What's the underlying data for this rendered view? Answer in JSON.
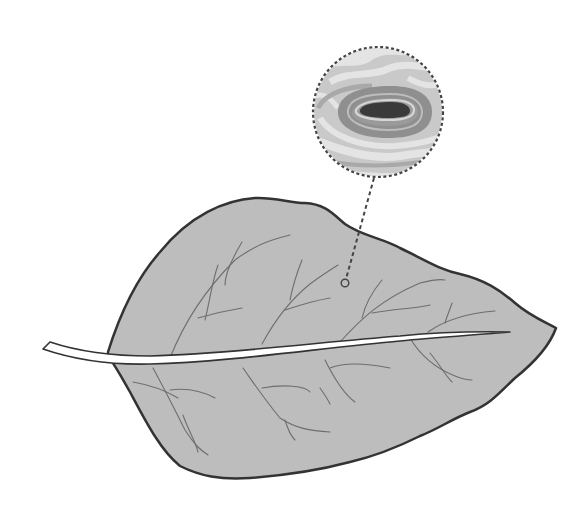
{
  "figure": {
    "inset": "magnified-lesion",
    "marker": "lesion-location-marker"
  },
  "colors": {
    "background": "#ffffff",
    "leaf_fill": "#bdbdbd",
    "leaf_outline": "#333333",
    "vein": "#6e6e6e",
    "midrib": "#ffffff",
    "inset_base": "#c9c9c9",
    "inset_light": "#e4e4e4",
    "lesion_outer": "#8f8f8f",
    "lesion_ring": "#a9a9a9",
    "lesion_core": "#3a3a3a",
    "dash": "#444444"
  }
}
